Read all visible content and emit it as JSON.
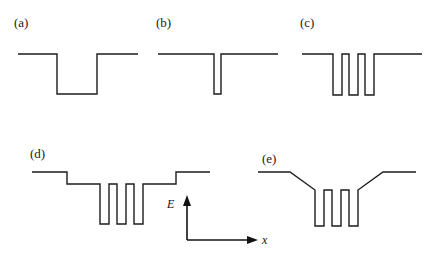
{
  "figure": {
    "background_color": "#ffffff",
    "line_color": "#1c1c1c",
    "width": 436,
    "height": 269
  },
  "axes": {
    "energy_label": "E",
    "position_label": "x",
    "origin_x": 187,
    "origin_y": 240,
    "energy_arrow_top_y": 196,
    "position_arrow_right_x": 258
  },
  "panels": [
    {
      "id": "a",
      "label": "(a)",
      "label_x": 14,
      "label_y": 16,
      "description": "single wide square quantum well",
      "well_count": 1,
      "well_width_px": 40,
      "well_depth_px": 40,
      "barrier_count": 0,
      "sides": "flat",
      "path": "M 18 54 L 57 54 L 57 94 L 97 94 L 97 54 L 138 54"
    },
    {
      "id": "b",
      "label": "(b)",
      "label_x": 156,
      "label_y": 16,
      "description": "single narrow deep quantum well",
      "well_count": 1,
      "well_width_px": 7,
      "well_depth_px": 40,
      "barrier_count": 0,
      "sides": "flat",
      "path": "M 158 54 L 214 54 L 214 94 L 221 94 L 221 54 L 278 54"
    },
    {
      "id": "c",
      "label": "(c)",
      "label_x": 300,
      "label_y": 16,
      "description": "three coupled narrow quantum wells (superlattice), flat outer barriers",
      "well_count": 3,
      "well_width_px": 9,
      "well_depth_px": 41,
      "barrier_count": 2,
      "barrier_width_px": 7,
      "sides": "flat",
      "path": "M 302 54 L 333 54 L 333 95 L 342 95 L 342 54 L 349 54 L 349 95 L 358 95 L 358 54 L 365 54 L 365 95 L 374 95 L 374 54 L 422 54"
    },
    {
      "id": "d",
      "label": "(d)",
      "label_x": 30,
      "label_y": 147,
      "description": "three quantum wells inside a stepped (two-level) confining potential",
      "well_count": 3,
      "well_width_px": 9,
      "well_depth_px": 40,
      "barrier_count": 2,
      "barrier_width_px": 8,
      "sides": "stepped",
      "step_height_px": 12,
      "path": "M 32 172 L 67 172 L 67 184 L 100 184 L 100 224 L 109 224 L 109 184 L 117 184 L 117 224 L 126 224 L 126 184 L 134 184 L 134 224 L 143 224 L 143 184 L 176 184 L 176 172 L 210 172"
    },
    {
      "id": "e",
      "label": "(e)",
      "label_x": 262,
      "label_y": 152,
      "description": "three quantum wells inside a graded (sloped) confining potential",
      "well_count": 3,
      "well_width_px": 9,
      "well_depth_px": 36,
      "barrier_count": 2,
      "barrier_width_px": 8,
      "sides": "graded-sloped",
      "path": "M 258 172 L 290 172 L 315 190 L 315 226 L 324 226 L 324 190 L 332 190 L 332 226 L 341 226 L 341 190 L 349 190 L 349 226 L 358 226 L 358 190 L 383 172 L 416 172"
    }
  ]
}
